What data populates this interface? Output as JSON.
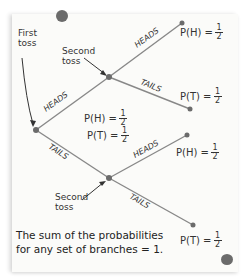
{
  "labels": {
    "first_toss": "First toss",
    "second_toss_top": "Second toss",
    "second_toss_bottom": "Second toss"
  },
  "branches": {
    "first_heads": "HEADS",
    "first_tails": "TAILS",
    "top_heads": "HEADS",
    "top_tails": "TAILS",
    "bottom_heads": "HEADS",
    "bottom_tails": "TAILS"
  },
  "probabilities": {
    "first": {
      "ph": "P(H) =",
      "pt": "P(T) =",
      "num": "1",
      "den": "2"
    },
    "top_heads": {
      "label": "P(H) =",
      "num": "1",
      "den": "2"
    },
    "top_tails": {
      "label": "P(T) =",
      "num": "1",
      "den": "2"
    },
    "bottom_heads": {
      "label": "P(H) =",
      "num": "1",
      "den": "2"
    },
    "bottom_tails": {
      "label": "P(T) =",
      "num": "1",
      "den": "2"
    }
  },
  "footer": {
    "line1": "The sum of the probabilities",
    "line2": "for any set of branches = 1."
  },
  "colors": {
    "line": "#888888",
    "node": "#6b6b6b",
    "text": "#333333"
  }
}
